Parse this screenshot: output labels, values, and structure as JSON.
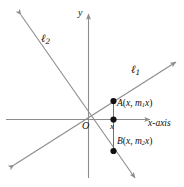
{
  "figure": {
    "kind": "coordinate-plane-diagram",
    "width": 184,
    "height": 187,
    "background_color": "#ffffff",
    "line_color": "#8c8c8c",
    "axis_color": "#8c8c8c",
    "point_color": "#111111",
    "text_color": "#111111"
  },
  "axes": {
    "x_axis_label": "x-axis",
    "y_axis_label": "y",
    "origin_label": "O"
  },
  "lines": [
    {
      "id": "ell1",
      "label_base": "ℓ",
      "label_sub": "1",
      "description": "line through origin with positive slope m1",
      "slope_sign": "positive"
    },
    {
      "id": "ell2",
      "label_base": "ℓ",
      "label_sub": "2",
      "description": "line through origin with negative slope m2",
      "slope_sign": "negative"
    }
  ],
  "points": [
    {
      "id": "A",
      "label_name": "A",
      "label_coords_open": "(",
      "label_x": "x",
      "label_sep": ", ",
      "label_slope_base": "m",
      "label_slope_sub": "1",
      "label_slope_var": "x",
      "label_coords_close": ")",
      "full_label": "A(x, m1x)",
      "on_line": "ell1"
    },
    {
      "id": "B",
      "label_name": "B",
      "label_coords_open": "(",
      "label_x": "x",
      "label_sep": ", ",
      "label_slope_base": "m",
      "label_slope_sub": "2",
      "label_slope_var": "x",
      "label_coords_close": ")",
      "full_label": "B(x, m2x)",
      "on_line": "ell2"
    },
    {
      "id": "X",
      "label_name": "x",
      "full_label": "x",
      "on_line": "x-axis"
    }
  ]
}
